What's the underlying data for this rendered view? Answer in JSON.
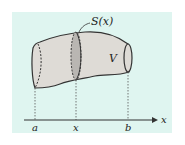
{
  "figure": {
    "colors": {
      "panel_background": "#dff5f0",
      "solid_fill": "#dedbd6",
      "cross_section_fill": "#b9b6b2",
      "outline": "#333333",
      "axis": "#333333"
    },
    "labels": {
      "cross_section": "S(x)",
      "volume": "V",
      "axis": "x",
      "left_bound": "a",
      "slice_position": "x",
      "right_bound": "b"
    }
  }
}
